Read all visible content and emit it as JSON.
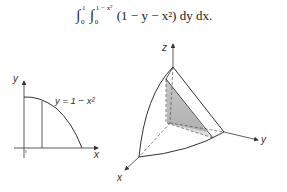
{
  "formula": {
    "outer_int_upper": "1",
    "outer_int_lower": "0",
    "inner_int_upper": "1 − x²",
    "inner_int_lower": "0",
    "integrand": "(1 − y − x²) dy dx."
  },
  "plot2d": {
    "y_label": "y",
    "x_label": "x",
    "curve_label": "y = 1 − x²",
    "tick_label": "1"
  },
  "plot3d": {
    "z_label": "z",
    "y_label": "y",
    "x_label": "x"
  },
  "colors": {
    "line": "#333333",
    "shade_top": "#c8c8c8",
    "shade_bottom": "#a8a8a8"
  }
}
